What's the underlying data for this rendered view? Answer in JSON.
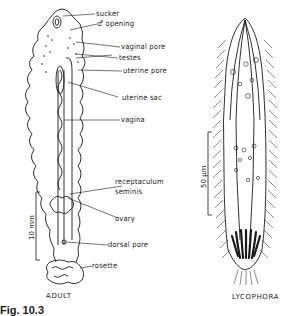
{
  "figure": {
    "number_label": "Fig. 10.3",
    "colors": {
      "ink": "#1a1a1a",
      "background": "#ffffff"
    }
  },
  "adult": {
    "caption": "ADULT",
    "scale_bar": "10 mm",
    "labels": {
      "sucker": "sucker",
      "male_opening": "♂ opening",
      "vaginal_pore": "vaginal pore",
      "testes": "testes",
      "uterine_pore": "uterine pore",
      "uterine_sac": "uterine sac",
      "vagina": "vagina",
      "receptaculum_1": "receptaculum",
      "receptaculum_2": "seminis",
      "ovary": "ovary",
      "dorsal_pore": "dorsal pore",
      "rosette": "rosette"
    }
  },
  "larva": {
    "caption": "LYCOPHORA",
    "scale_bar": "50 µm"
  }
}
